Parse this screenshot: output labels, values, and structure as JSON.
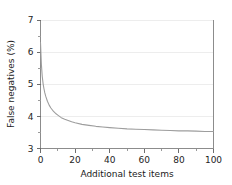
{
  "chart_data": {
    "type": "line",
    "title": "",
    "xlabel": "Additional test items",
    "ylabel": "False negatives (%)",
    "xlim": [
      0,
      100
    ],
    "ylim": [
      3,
      7
    ],
    "grid": true,
    "legend": "none",
    "x_ticks": [
      0,
      20,
      40,
      60,
      80,
      100
    ],
    "x_tick_labels": [
      "0",
      "20",
      "40",
      "60",
      "80",
      "100"
    ],
    "x_minor_ticks": [
      10,
      30,
      50,
      70,
      90
    ],
    "y_ticks": [
      3,
      4,
      5,
      6,
      7
    ],
    "y_tick_labels": [
      "3",
      "4",
      "5",
      "6",
      "7"
    ],
    "y_minor_ticks": [
      3.5,
      4.5,
      5.5,
      6.5
    ],
    "series": [
      {
        "name": "False negatives",
        "color": "#9d9d9d",
        "x": [
          0,
          0.5,
          1,
          1.5,
          2,
          2.5,
          3,
          4,
          5,
          6,
          7,
          8,
          9,
          10,
          12,
          14,
          16,
          18,
          20,
          24,
          28,
          32,
          36,
          40,
          45,
          50,
          55,
          60,
          65,
          70,
          75,
          80,
          85,
          90,
          95,
          100
        ],
        "y": [
          6.3,
          5.62,
          5.25,
          5.02,
          4.86,
          4.73,
          4.63,
          4.47,
          4.35,
          4.26,
          4.19,
          4.13,
          4.08,
          4.04,
          3.96,
          3.91,
          3.87,
          3.83,
          3.8,
          3.75,
          3.72,
          3.69,
          3.67,
          3.65,
          3.63,
          3.61,
          3.6,
          3.59,
          3.58,
          3.57,
          3.56,
          3.55,
          3.55,
          3.54,
          3.53,
          3.53
        ]
      }
    ]
  },
  "axes": {
    "y_axis_label": "False negatives (%)",
    "x_axis_label": "Additional test items"
  }
}
